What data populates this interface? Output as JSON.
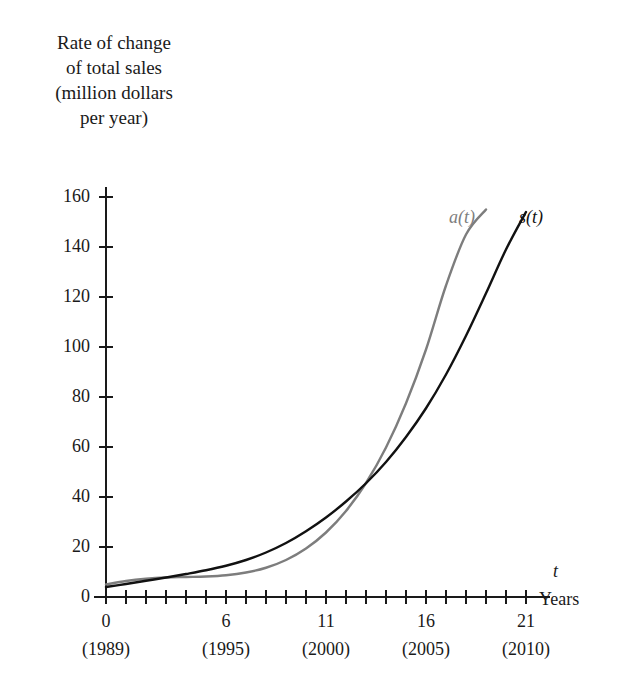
{
  "chart_data": {
    "type": "line",
    "title": "",
    "ylabel": "Rate of change\nof total sales\n(million dollars\nper year)",
    "xlabel": "Years",
    "x_axis_symbol": "t",
    "xlim": [
      0,
      22
    ],
    "ylim": [
      0,
      168
    ],
    "grid": false,
    "legend_position": "at-curve-ends",
    "x_tick_values": [
      0,
      6,
      11,
      16,
      21
    ],
    "x_tick_labels": [
      "0",
      "6",
      "11",
      "16",
      "21"
    ],
    "x_tick_sublabels": [
      "(1989)",
      "(1995)",
      "(2000)",
      "(2005)",
      "(2010)"
    ],
    "x_minor_tick_step": 1,
    "y_tick_values": [
      0,
      20,
      40,
      60,
      80,
      100,
      120,
      140,
      160
    ],
    "y_tick_labels": [
      "0",
      "20",
      "40",
      "60",
      "80",
      "100",
      "120",
      "140",
      "160"
    ],
    "series": [
      {
        "name": "a(t)",
        "label": "a(t)",
        "color": "#7d7d7d",
        "x": [
          0,
          1,
          2,
          3,
          4,
          5,
          6,
          7,
          8,
          9,
          10,
          11,
          12,
          13,
          14,
          15,
          16,
          17,
          18,
          19
        ],
        "values": [
          5.0,
          6.4,
          7.3,
          7.8,
          8.0,
          8.2,
          8.7,
          9.8,
          11.7,
          14.8,
          19.4,
          25.8,
          34.4,
          45.6,
          59.8,
          77.5,
          99.0,
          124.6,
          145.0,
          155.0
        ]
      },
      {
        "name": "s(t)",
        "label": "s(t)",
        "color": "#111111",
        "x": [
          0,
          1,
          2,
          3,
          4,
          5,
          6,
          7,
          8,
          9,
          10,
          11,
          12,
          13,
          14,
          15,
          16,
          17,
          18,
          19,
          20,
          21
        ],
        "values": [
          4.0,
          5.2,
          6.5,
          7.8,
          9.2,
          10.7,
          12.5,
          14.8,
          17.8,
          21.6,
          26.3,
          31.8,
          38.2,
          45.5,
          54.0,
          64.0,
          75.5,
          89.0,
          104.5,
          121.5,
          139.0,
          154.0
        ]
      }
    ]
  },
  "curve_labels": {
    "a_label": "a(t)",
    "s_label": "s(t)"
  },
  "axis_titles": {
    "x_symbol": "t",
    "x_units": "Years",
    "y_line1": "Rate of change",
    "y_line2": "of total sales",
    "y_line3": "(million dollars",
    "y_line4": "per year)"
  },
  "colors": {
    "a_curve": "#7d7d7d",
    "s_curve": "#111111",
    "axis": "#1a1a1a",
    "background": "#ffffff"
  }
}
